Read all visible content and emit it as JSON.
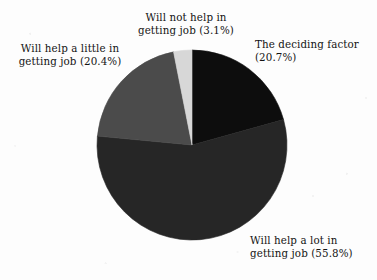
{
  "chart_data": {
    "type": "pie",
    "title": "",
    "subtitle": "",
    "xlabel": "",
    "ylabel": "",
    "legend_position": "none",
    "grid": false,
    "labels_outside": true,
    "center": {
      "x": 192,
      "y": 145
    },
    "radius": 95,
    "start_angle_deg": 0,
    "direction": "clockwise",
    "categories": [
      "The deciding factor",
      "Will help a lot in getting job",
      "Will help a little in getting job",
      "Will not help in getting job"
    ],
    "values": [
      20.7,
      55.8,
      20.4,
      3.1
    ],
    "value_unit": "%",
    "colors": [
      "#0d0d0d",
      "#262626",
      "#4b4b4b",
      "#d7d7d7"
    ],
    "slices": [
      {
        "name": "the-deciding-factor",
        "label_line1": "The deciding factor",
        "label_line2": "(20.7%)",
        "value": 20.7,
        "color": "#0d0d0d",
        "start_deg": 0,
        "end_deg": 74.5
      },
      {
        "name": "will-help-a-lot",
        "label_line1": "Will help a lot in",
        "label_line2": "getting job (55.8%)",
        "value": 55.8,
        "color": "#262626",
        "start_deg": 74.5,
        "end_deg": 275.4
      },
      {
        "name": "will-help-a-little",
        "label_line1": "Will help a little in",
        "label_line2": "getting job (20.4%)",
        "value": 20.4,
        "color": "#4b4b4b",
        "start_deg": 275.4,
        "end_deg": 348.8
      },
      {
        "name": "will-not-help",
        "label_line1": "Will not help in",
        "label_line2": "getting job (3.1%)",
        "value": 3.1,
        "color": "#d7d7d7",
        "start_deg": 348.8,
        "end_deg": 360
      }
    ]
  },
  "labels": {
    "top": "Will not help in\ngetting job (3.1%)",
    "left": "Will help a little in\ngetting job (20.4%)",
    "right": "The deciding factor\n(20.7%)",
    "bottom": "Will help a lot in\ngetting job (55.8%)"
  },
  "colors": {
    "background": "#fdfdfd",
    "text": "#141414",
    "slice_deciding": "#0d0d0d",
    "slice_a_lot": "#262626",
    "slice_a_little": "#4b4b4b",
    "slice_not_help": "#d7d7d7"
  }
}
